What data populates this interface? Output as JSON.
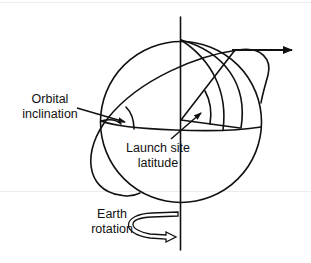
{
  "diagram": {
    "labels": {
      "orbital_inclination": [
        "Orbital",
        "inclination"
      ],
      "launch_site_latitude": [
        "Launch site",
        "latitude"
      ],
      "earth_rotation": [
        "Earth",
        "rotation"
      ]
    },
    "colors": {
      "stroke": "#111111",
      "background": "#ffffff"
    }
  }
}
